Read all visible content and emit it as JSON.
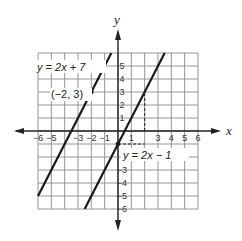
{
  "chart_data": {
    "type": "line",
    "title": "",
    "xlabel": "x",
    "ylabel": "y",
    "xlim": [
      -6,
      6
    ],
    "ylim": [
      -6,
      6
    ],
    "grid": true,
    "x_ticks": [
      "-6",
      "-5",
      "-3",
      "-2",
      "-1",
      "1",
      "3",
      "4",
      "5",
      "6"
    ],
    "y_ticks": [
      "5",
      "4",
      "3",
      "2",
      "1",
      "-3",
      "-4",
      "-5",
      "-6"
    ],
    "series": [
      {
        "name": "y = 2x + 7",
        "slope": 2,
        "intercept": 7,
        "x": [
          -6,
          -0.5
        ],
        "y": [
          -5,
          6
        ]
      },
      {
        "name": "y = 2x - 1",
        "slope": 2,
        "intercept": -1,
        "x": [
          -2.5,
          3.5
        ],
        "y": [
          -6,
          6
        ]
      }
    ],
    "annotations": [
      {
        "label": "(-2, 3)",
        "x": -2,
        "y": 3,
        "type": "point"
      },
      {
        "label": "",
        "x": 0,
        "y": -1,
        "type": "point"
      },
      {
        "label": "dashed guide",
        "from": [
          2,
          0
        ],
        "to": [
          2,
          3
        ],
        "type": "dashed"
      },
      {
        "label": "dashed guide",
        "from": [
          0,
          -1
        ],
        "to": [
          2,
          -1
        ],
        "type": "dashed"
      }
    ]
  },
  "labels": {
    "x_axis": "x",
    "y_axis": "y",
    "line1_label": "y = 2x + 7",
    "line2_label": "y = 2x − 1",
    "point_label": "(−2, 3)"
  },
  "ticks": {
    "x": [
      {
        "v": -6,
        "t": "−6"
      },
      {
        "v": -5,
        "t": "−5"
      },
      {
        "v": -3,
        "t": "−3"
      },
      {
        "v": -2,
        "t": "−2"
      },
      {
        "v": -1,
        "t": "−1"
      },
      {
        "v": 1,
        "t": "1"
      },
      {
        "v": 3,
        "t": "3"
      },
      {
        "v": 4,
        "t": "4"
      },
      {
        "v": 5,
        "t": "5"
      },
      {
        "v": 6,
        "t": "6"
      }
    ],
    "y": [
      {
        "v": 5,
        "t": "5"
      },
      {
        "v": 4,
        "t": "4"
      },
      {
        "v": 3,
        "t": "3"
      },
      {
        "v": 2,
        "t": "2"
      },
      {
        "v": 1,
        "t": "1"
      },
      {
        "v": -3,
        "t": "−3"
      },
      {
        "v": -4,
        "t": "−4"
      },
      {
        "v": -5,
        "t": "−5"
      },
      {
        "v": -6,
        "t": "−6"
      }
    ]
  },
  "colors": {
    "grid": "#8a8a8a",
    "axis": "#222222",
    "line": "#1a1a1a"
  }
}
